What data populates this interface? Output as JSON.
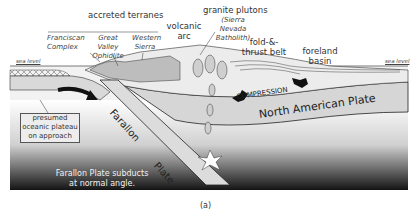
{
  "figure": {
    "caption": "(a)",
    "labels": {
      "accreted_terranes": "accreted terranes",
      "franciscan": "Franciscan Complex",
      "great_valley": "Great Valley Ophiolite",
      "western_sierra": "Western Sierra",
      "volcanic_arc": "volcanic arc",
      "granite_plutons": "granite plutons",
      "sierra_nevada": "(Sierra Nevada Batholith)",
      "fold_thrust": "fold-&-thrust belt",
      "foreland_basin": "foreland basin",
      "sea_level_left": "sea level",
      "sea_level_right": "sea level",
      "plateau": "presumed oceanic plateau on approach",
      "compression": "COMPRESSION",
      "north_american_plate": "North American Plate",
      "farallon": "Farallon",
      "plate": "Plate",
      "subducts": "Farallon Plate subducts at normal angle."
    },
    "colors": {
      "plate_fill": "#d9d9d9",
      "deep_dark": "#1a1a1a",
      "outline": "#333333"
    }
  }
}
